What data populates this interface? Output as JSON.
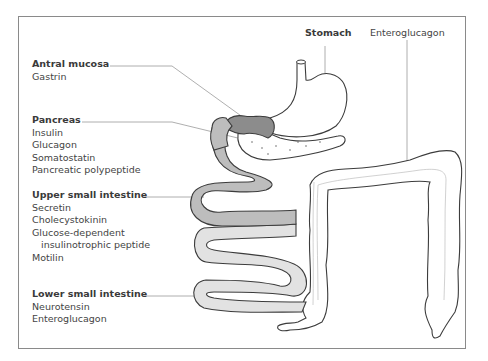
{
  "diagram": {
    "type": "anatomical-illustration",
    "colors": {
      "antral_mucosa_fill": "#8c8c8c",
      "upper_small_intestine_fill": "#bdbdbd",
      "lower_small_intestine_fill": "#e2e2e2",
      "outline": "#3c3c3c",
      "leader_line": "#9a9a9a",
      "frame": "#8a8a8a"
    }
  },
  "labels": {
    "stomach": "Stomach",
    "enteroglucagon_top": "Enteroglucagon"
  },
  "groups": [
    {
      "heading": "Antral mucosa",
      "items": [
        "Gastrin"
      ]
    },
    {
      "heading": "Pancreas",
      "items": [
        "Insulin",
        "Glucagon",
        "Somatostatin",
        "Pancreatic polypeptide"
      ]
    },
    {
      "heading": "Upper small intestine",
      "items": [
        "Secretin",
        "Cholecystokinin",
        "Glucose-dependent",
        "insulinotrophic peptide",
        "Motilin"
      ]
    },
    {
      "heading": "Lower small intestine",
      "items": [
        "Neurotensin",
        "Enteroglucagon"
      ]
    }
  ]
}
